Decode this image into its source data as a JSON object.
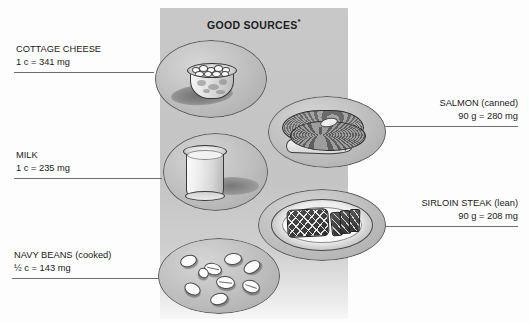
{
  "figure": {
    "panel_title": "GOOD SOURCES",
    "panel_title_footnote": "*",
    "panel_color": "#c6c6c6",
    "background_color": "#ffffff",
    "text_color": "#1a1a1a",
    "leader_line_color": "#6e6e6e"
  },
  "items": [
    {
      "id": "cottage-cheese",
      "name": "COTTAGE CHEESE",
      "amount": "1 c = 341 mg",
      "serving": "1 c",
      "value": 341,
      "unit": "mg",
      "side": "left",
      "icon": "cottage-cheese-bowl-illustration"
    },
    {
      "id": "milk",
      "name": "MILK",
      "amount": "1 c = 235 mg",
      "serving": "1 c",
      "value": 235,
      "unit": "mg",
      "side": "left",
      "icon": "milk-glass-illustration"
    },
    {
      "id": "navy-beans",
      "name": "NAVY BEANS (cooked)",
      "amount": "½ c = 143 mg",
      "serving": "½ c",
      "value": 143,
      "unit": "mg",
      "side": "left",
      "icon": "navy-beans-illustration"
    },
    {
      "id": "salmon",
      "name": "SALMON (canned)",
      "amount": "90 g = 280 mg",
      "serving": "90 g",
      "value": 280,
      "unit": "mg",
      "side": "right",
      "icon": "salmon-steak-illustration"
    },
    {
      "id": "sirloin-steak",
      "name": "SIRLOIN STEAK (lean)",
      "amount": "90 g = 208 mg",
      "serving": "90 g",
      "value": 208,
      "unit": "mg",
      "side": "right",
      "icon": "sirloin-steak-plate-illustration"
    }
  ]
}
